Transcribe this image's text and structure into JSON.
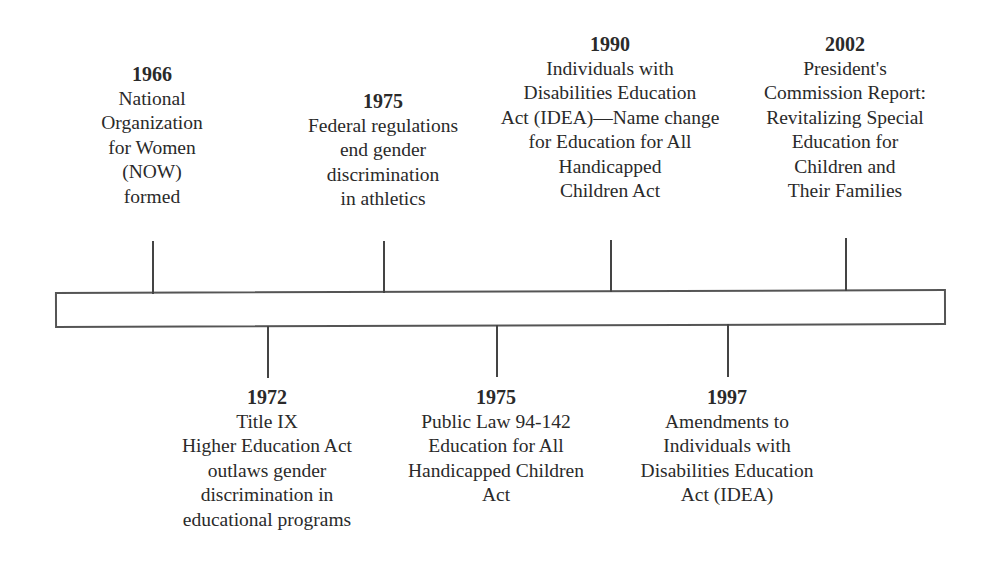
{
  "diagram": {
    "type": "timeline",
    "axis_color": "#555555",
    "events_above": [
      {
        "year": "1966",
        "lines": [
          "National",
          "Organization",
          "for Women",
          "(NOW)",
          "formed"
        ],
        "x": 152,
        "top": 62,
        "tick_top": 241
      },
      {
        "year": "1975",
        "lines": [
          "Federal regulations",
          "end gender",
          "discrimination",
          "in athletics"
        ],
        "x": 383,
        "top": 89,
        "tick_top": 241
      },
      {
        "year": "1990",
        "lines": [
          "Individuals with",
          "Disabilities Education",
          "Act (IDEA)—Name change",
          "for Education for All",
          "Handicapped",
          "Children Act"
        ],
        "x": 610,
        "top": 32,
        "tick_top": 240
      },
      {
        "year": "2002",
        "lines": [
          "President's",
          "Commission Report:",
          "Revitalizing Special",
          "Education for",
          "Children and",
          "Their Families"
        ],
        "x": 845,
        "top": 32,
        "tick_top": 238
      }
    ],
    "events_below": [
      {
        "year": "1972",
        "lines": [
          "Title IX",
          "Higher Education Act",
          "outlaws gender",
          "discrimination in",
          "educational programs"
        ],
        "x": 267,
        "top": 385,
        "tick_bottom": 378
      },
      {
        "year": "1975",
        "lines": [
          "Public Law 94-142",
          "Education for All",
          "Handicapped Children",
          "Act"
        ],
        "x": 496,
        "top": 385,
        "tick_bottom": 377
      },
      {
        "year": "1997",
        "lines": [
          "Amendments to",
          "Individuals with",
          "Disabilities Education",
          "Act (IDEA)"
        ],
        "x": 727,
        "top": 385,
        "tick_bottom": 377
      }
    ]
  }
}
